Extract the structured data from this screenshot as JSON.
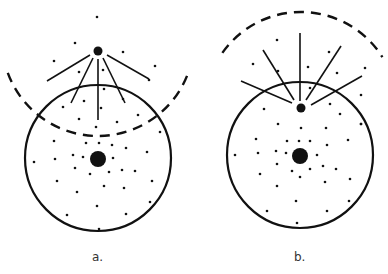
{
  "panels": [
    {
      "id": "a",
      "label": "a.",
      "label_pos": [
        92,
        262
      ],
      "circle": {
        "cx": 98,
        "cy": 158,
        "r": 73
      },
      "nucleus": {
        "cx": 98,
        "cy": 159,
        "r": 8
      },
      "source": {
        "cx": 98,
        "cy": 51,
        "r": 4.5
      },
      "arc": {
        "cx": 98,
        "cy": 40,
        "r": 96,
        "start_deg": 200,
        "end_deg": 340,
        "direction": "below"
      },
      "rays": [
        [
          90,
          55,
          47,
          81
        ],
        [
          93,
          58,
          71,
          103
        ],
        [
          98,
          59,
          98,
          120
        ],
        [
          103,
          58,
          125,
          103
        ],
        [
          107,
          55,
          149,
          79
        ]
      ],
      "dots": [
        [
          97,
          17
        ],
        [
          75,
          43
        ],
        [
          54,
          61
        ],
        [
          123,
          52
        ],
        [
          155,
          66
        ],
        [
          79,
          72
        ],
        [
          103,
          70
        ],
        [
          149,
          80
        ],
        [
          104,
          89
        ],
        [
          63,
          107
        ],
        [
          84,
          101
        ],
        [
          123,
          99
        ],
        [
          101,
          108
        ],
        [
          138,
          115
        ],
        [
          79,
          119
        ],
        [
          117,
          122
        ],
        [
          96,
          127
        ],
        [
          160,
          132
        ],
        [
          54,
          141
        ],
        [
          86,
          143
        ],
        [
          99,
          143
        ],
        [
          112,
          145
        ],
        [
          126,
          148
        ],
        [
          147,
          152
        ],
        [
          34,
          162
        ],
        [
          55,
          159
        ],
        [
          73,
          155
        ],
        [
          83,
          157
        ],
        [
          113,
          158
        ],
        [
          75,
          168
        ],
        [
          90,
          174
        ],
        [
          109,
          172
        ],
        [
          122,
          170
        ],
        [
          135,
          171
        ],
        [
          57,
          181
        ],
        [
          152,
          181
        ],
        [
          104,
          186
        ],
        [
          124,
          188
        ],
        [
          77,
          192
        ],
        [
          150,
          202
        ],
        [
          97,
          206
        ],
        [
          67,
          215
        ],
        [
          126,
          214
        ],
        [
          99,
          229
        ]
      ]
    },
    {
      "id": "b",
      "label": "b.",
      "label_pos": [
        294,
        262
      ],
      "circle": {
        "cx": 300,
        "cy": 155,
        "r": 73
      },
      "nucleus": {
        "cx": 300,
        "cy": 156,
        "r": 8
      },
      "source": {
        "cx": 301,
        "cy": 108,
        "r": 4.5
      },
      "arc": {
        "cx": 301,
        "cy": 108,
        "r": 96,
        "start_deg": 215,
        "end_deg": 328,
        "direction": "above"
      },
      "rays": [
        [
          292,
          103,
          241,
          81
        ],
        [
          294,
          100,
          263,
          50
        ],
        [
          300,
          101,
          300,
          33
        ],
        [
          306,
          100,
          341,
          46
        ],
        [
          311,
          105,
          362,
          76
        ]
      ],
      "dots": [
        [
          277,
          40
        ],
        [
          253,
          64
        ],
        [
          329,
          52
        ],
        [
          278,
          71
        ],
        [
          308,
          67
        ],
        [
          337,
          73
        ],
        [
          365,
          68
        ],
        [
          310,
          88
        ],
        [
          361,
          95
        ],
        [
          264,
          109
        ],
        [
          330,
          104
        ],
        [
          340,
          114
        ],
        [
          361,
          124
        ],
        [
          278,
          124
        ],
        [
          301,
          128
        ],
        [
          326,
          128
        ],
        [
          361,
          124
        ],
        [
          256,
          139
        ],
        [
          287,
          141
        ],
        [
          299,
          141
        ],
        [
          310,
          141
        ],
        [
          327,
          145
        ],
        [
          348,
          140
        ],
        [
          235,
          155
        ],
        [
          258,
          153
        ],
        [
          276,
          151
        ],
        [
          286,
          153
        ],
        [
          317,
          155
        ],
        [
          277,
          164
        ],
        [
          292,
          171
        ],
        [
          310,
          169
        ],
        [
          323,
          166
        ],
        [
          336,
          169
        ],
        [
          260,
          174
        ],
        [
          350,
          179
        ],
        [
          300,
          177
        ],
        [
          325,
          182
        ],
        [
          277,
          186
        ],
        [
          349,
          201
        ],
        [
          296,
          201
        ],
        [
          267,
          211
        ],
        [
          327,
          211
        ],
        [
          297,
          223
        ]
      ]
    }
  ],
  "colors": {
    "ink": "#111111",
    "background": "#ffffff"
  }
}
